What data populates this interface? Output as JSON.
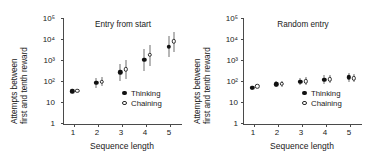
{
  "figure": {
    "width": 366,
    "height": 163,
    "background": "#ffffff",
    "axis_color": "#4a4a4a",
    "errorbar_color": "#6e6e6e",
    "marker_filled_color": "#111111",
    "marker_open_color": "#ffffff"
  },
  "panels": [
    {
      "id": "entry-from-start",
      "title": "Entry from start",
      "xlabel": "Sequence length",
      "ylabel_line1": "Attempts between",
      "ylabel_line2": "first and tenth reward",
      "legend": [
        {
          "label": "Thinking",
          "marker": "filled-circle"
        },
        {
          "label": "Chaining",
          "marker": "open-circle"
        }
      ],
      "yticks": [
        "10⁵",
        "10⁴",
        "10³",
        "10²",
        "10",
        "1"
      ],
      "ytick_values": [
        100000,
        10000,
        1000,
        100,
        10,
        1
      ],
      "xticks": [
        "1",
        "2",
        "3",
        "4",
        "5"
      ]
    },
    {
      "id": "random-entry",
      "title": "Random entry",
      "xlabel": "Sequence length",
      "ylabel_line1": "Attempts between",
      "ylabel_line2": "first and tenth reward",
      "legend": [
        {
          "label": "Thinking",
          "marker": "filled-circle"
        },
        {
          "label": "Chaining",
          "marker": "open-circle"
        }
      ],
      "yticks": [
        "10⁵",
        "10⁴",
        "10³",
        "10²",
        "10",
        "1"
      ],
      "ytick_values": [
        100000,
        10000,
        1000,
        100,
        10,
        1
      ],
      "xticks": [
        "1",
        "2",
        "3",
        "4",
        "5"
      ]
    }
  ],
  "chart_data": [
    {
      "type": "scatter",
      "title": "Entry from start",
      "xlabel": "Sequence length",
      "ylabel": "Attempts between first and tenth reward",
      "yscale": "log",
      "ylim": [
        1,
        100000
      ],
      "xlim": [
        0.55,
        5.45
      ],
      "grid": false,
      "legend_position": "bottom-right",
      "x": [
        1,
        2,
        3,
        4,
        5
      ],
      "series": [
        {
          "name": "Thinking",
          "marker": "filled-circle",
          "values": [
            35,
            85,
            270,
            1100,
            4500
          ],
          "err_low": [
            30,
            52,
            110,
            330,
            1500
          ],
          "err_high": [
            42,
            150,
            700,
            3300,
            14000
          ]
        },
        {
          "name": "Chaining",
          "marker": "open-circle",
          "values": [
            38,
            100,
            380,
            1800,
            8000
          ],
          "err_low": [
            34,
            62,
            130,
            520,
            2600
          ],
          "err_high": [
            44,
            170,
            1100,
            5500,
            23000
          ]
        }
      ]
    },
    {
      "type": "scatter",
      "title": "Random entry",
      "xlabel": "Sequence length",
      "ylabel": "Attempts between first and tenth reward",
      "yscale": "log",
      "ylim": [
        1,
        100000
      ],
      "xlim": [
        0.55,
        5.45
      ],
      "grid": false,
      "legend_position": "bottom-right",
      "x": [
        1,
        2,
        3,
        4,
        5
      ],
      "series": [
        {
          "name": "Thinking",
          "marker": "filled-circle",
          "values": [
            50,
            75,
            100,
            125,
            160
          ],
          "err_low": [
            42,
            55,
            68,
            80,
            100
          ],
          "err_high": [
            60,
            105,
            150,
            200,
            260
          ]
        },
        {
          "name": "Chaining",
          "marker": "open-circle",
          "values": [
            60,
            78,
            105,
            130,
            145
          ],
          "err_low": [
            50,
            56,
            70,
            85,
            95
          ],
          "err_high": [
            72,
            110,
            160,
            210,
            240
          ]
        }
      ]
    }
  ]
}
